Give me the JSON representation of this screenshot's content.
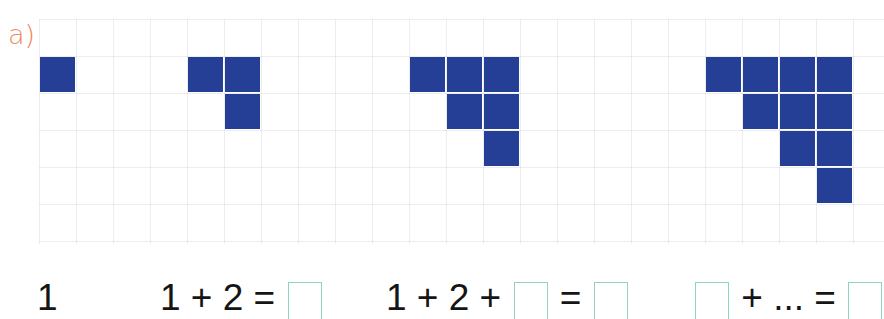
{
  "exercise": {
    "label": "a)",
    "colors": {
      "label": "#f0875a",
      "block": "#243f95",
      "block_gap": "#c9d1ea",
      "box_border": "#8fd6b8",
      "text": "#151515"
    },
    "grid": {
      "cell_size_px": 37,
      "rows": 6,
      "cols": 23
    },
    "figures": [
      {
        "name": "figure-1",
        "rows": [
          1
        ],
        "cells": [
          [
            0,
            0
          ]
        ],
        "origin_col": 0,
        "total": 1
      },
      {
        "name": "figure-2",
        "rows": [
          2,
          1
        ],
        "cells": [
          [
            0,
            0
          ],
          [
            0,
            1
          ],
          [
            1,
            1
          ]
        ],
        "origin_col": 4,
        "total": 3
      },
      {
        "name": "figure-3",
        "rows": [
          3,
          2,
          1
        ],
        "cells": [
          [
            0,
            0
          ],
          [
            0,
            1
          ],
          [
            0,
            2
          ],
          [
            1,
            1
          ],
          [
            1,
            2
          ],
          [
            2,
            2
          ]
        ],
        "origin_col": 10,
        "total": 6
      },
      {
        "name": "figure-4",
        "rows": [
          4,
          3,
          2,
          1
        ],
        "cells": [
          [
            0,
            0
          ],
          [
            0,
            1
          ],
          [
            0,
            2
          ],
          [
            0,
            3
          ],
          [
            1,
            1
          ],
          [
            1,
            2
          ],
          [
            1,
            3
          ],
          [
            2,
            2
          ],
          [
            2,
            3
          ],
          [
            3,
            3
          ]
        ],
        "origin_col": 18,
        "total": 10
      }
    ],
    "formulas": [
      {
        "tokens": [
          {
            "type": "text",
            "value": "1"
          }
        ]
      },
      {
        "tokens": [
          {
            "type": "text",
            "value": "1 + 2 = "
          },
          {
            "type": "box",
            "value": ""
          }
        ]
      },
      {
        "tokens": [
          {
            "type": "text",
            "value": "1 + 2 + "
          },
          {
            "type": "box",
            "value": ""
          },
          {
            "type": "text",
            "value": " = "
          },
          {
            "type": "box",
            "value": ""
          }
        ]
      },
      {
        "tokens": [
          {
            "type": "box",
            "value": ""
          },
          {
            "type": "text",
            "value": " + ... = "
          },
          {
            "type": "box",
            "value": ""
          }
        ]
      }
    ],
    "formula_text": {
      "f1": "1",
      "f2_lhs": "1 + 2 = ",
      "f3_lhs": "1 + 2 + ",
      "f3_eq": " = ",
      "f4_mid": " + ... = "
    }
  }
}
